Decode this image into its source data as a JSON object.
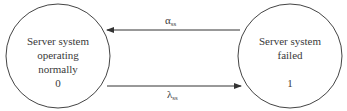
{
  "diagram": {
    "type": "state-transition",
    "nodes": [
      {
        "id": "0",
        "label": "Server system operating normally",
        "label_lines": [
          "Server system",
          "operating",
          "normally"
        ],
        "state_number": "0"
      },
      {
        "id": "1",
        "label": "Server system failed",
        "label_lines": [
          "Server system",
          "failed"
        ],
        "state_number": "1"
      }
    ],
    "edges": [
      {
        "from": "1",
        "to": "0",
        "symbol": "α",
        "subscript": "ss",
        "label": "αss"
      },
      {
        "from": "0",
        "to": "1",
        "symbol": "λ",
        "subscript": "ss",
        "label": "λss"
      }
    ],
    "colors": {
      "line": "#333333",
      "text": "#3a3a3a",
      "background": "#ffffff"
    }
  }
}
